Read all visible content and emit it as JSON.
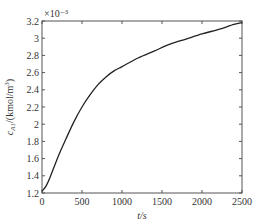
{
  "chart_data": {
    "type": "line",
    "title": "",
    "xlabel": "t/s",
    "ylabel": "c_A1/(kmol/m^3)",
    "y_multiplier": "×10⁻³",
    "xlim": [
      0,
      2500
    ],
    "ylim": [
      1.2,
      3.2
    ],
    "xticks": [
      "0",
      "500",
      "1000",
      "1500",
      "2000",
      "2500"
    ],
    "yticks": [
      "1.2",
      "1.4",
      "1.6",
      "1.8",
      "2",
      "2.2",
      "2.4",
      "2.6",
      "2.8",
      "3",
      "3.2"
    ],
    "grid": false,
    "series": [
      {
        "name": "c_A1",
        "x": [
          0,
          50,
          100,
          200,
          300,
          400,
          500,
          600,
          700,
          800,
          900,
          1000,
          1200,
          1400,
          1600,
          1800,
          2000,
          2200,
          2400,
          2500
        ],
        "y": [
          1.22,
          1.28,
          1.38,
          1.62,
          1.83,
          2.03,
          2.2,
          2.34,
          2.46,
          2.55,
          2.62,
          2.67,
          2.77,
          2.85,
          2.93,
          2.99,
          3.05,
          3.1,
          3.16,
          3.18
        ]
      }
    ]
  }
}
